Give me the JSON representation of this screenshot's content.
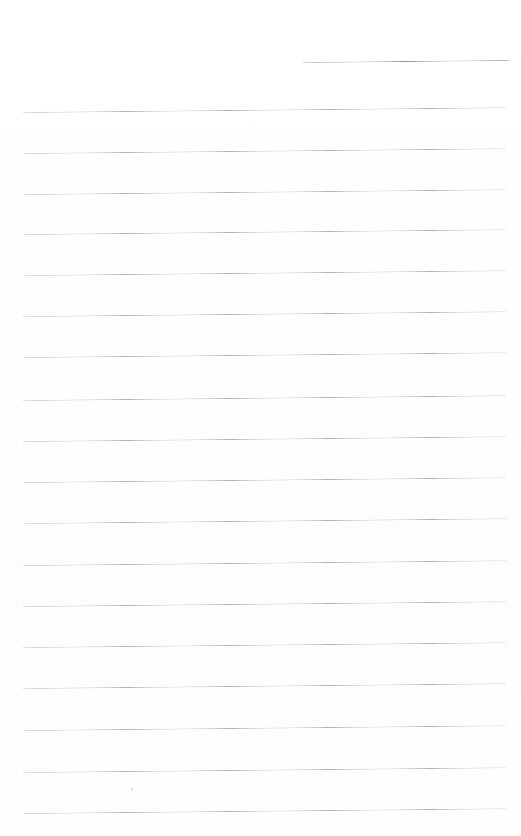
{
  "document": {
    "kind": "scanned-ruled-notebook-page",
    "title": "",
    "body_text": "",
    "page_width": 521,
    "page_height": 836,
    "background_color": "#fefefe",
    "is_blank": true
  },
  "ink": {
    "rule_color": "#a9a9ae",
    "header_rule_color": "#8e8e94",
    "rule_thickness_px": 1,
    "slant_degrees": -0.55
  },
  "header_rule": {
    "name": "title-rule",
    "x": 303,
    "y": 62,
    "width": 206,
    "text": ""
  },
  "ruled_lines": {
    "count": 18,
    "left_x": 23,
    "right_x": 506,
    "width": 483,
    "spacing_px": 40.7,
    "first_y": 112,
    "last_y": 813,
    "rows": [
      {
        "index": 1,
        "y": 112,
        "text": ""
      },
      {
        "index": 2,
        "y": 153,
        "text": ""
      },
      {
        "index": 3,
        "y": 194,
        "text": ""
      },
      {
        "index": 4,
        "y": 234,
        "text": ""
      },
      {
        "index": 5,
        "y": 275,
        "text": ""
      },
      {
        "index": 6,
        "y": 316,
        "text": ""
      },
      {
        "index": 7,
        "y": 357,
        "text": ""
      },
      {
        "index": 8,
        "y": 400,
        "text": ""
      },
      {
        "index": 9,
        "y": 441,
        "text": ""
      },
      {
        "index": 10,
        "y": 482,
        "text": ""
      },
      {
        "index": 11,
        "y": 523,
        "text": ""
      },
      {
        "index": 12,
        "y": 565,
        "text": ""
      },
      {
        "index": 13,
        "y": 606,
        "text": ""
      },
      {
        "index": 14,
        "y": 647,
        "text": ""
      },
      {
        "index": 15,
        "y": 688,
        "text": ""
      },
      {
        "index": 16,
        "y": 730,
        "text": ""
      },
      {
        "index": 17,
        "y": 772,
        "text": ""
      },
      {
        "index": 18,
        "y": 813,
        "text": ""
      }
    ]
  },
  "artifacts": [
    {
      "name": "scan-speck",
      "x": 131,
      "y": 788,
      "color": "#d9d9dd"
    }
  ]
}
